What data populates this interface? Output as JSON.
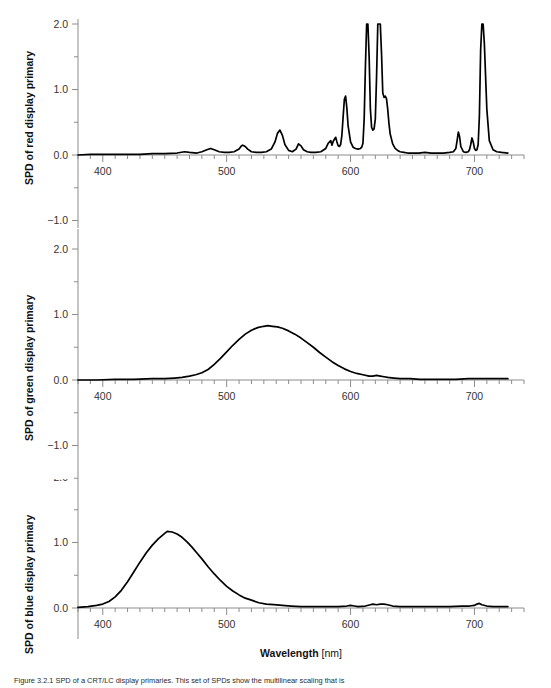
{
  "figure": {
    "xaxis_title_bold": "Wavelength",
    "xaxis_title_unit": "[nm]",
    "caption": "Figure 3.2.1 SPD of a CRT/LC display primaries. This set of SPDs show the multilinear scaling that is"
  },
  "chart_data": [
    {
      "type": "line",
      "id": "red",
      "title": "",
      "ylabel": "SPD of red display primary",
      "xlabel": "Wavelength [nm]",
      "xlim": [
        380,
        740
      ],
      "ylim": [
        -1.6,
        2.0
      ],
      "xticks_labeled": [
        400,
        500,
        600,
        700
      ],
      "xtick_minor_step": 10,
      "yticks_labeled": [
        2.0,
        1.0,
        0.0,
        -1.0
      ],
      "ytick_minor_step": 0.5,
      "grid": false,
      "legend": "none",
      "clipped_at": 2.0,
      "note": "Narrow-band phosphor emission spectrum; three peaks clipped at y=2.0",
      "x": [
        380,
        390,
        400,
        410,
        420,
        430,
        440,
        450,
        460,
        466,
        470,
        476,
        480,
        484,
        487,
        490,
        494,
        498,
        502,
        506,
        510,
        512,
        513,
        515,
        517,
        520,
        524,
        528,
        532,
        536,
        539,
        541,
        543,
        545,
        547,
        550,
        553,
        556,
        558,
        560,
        562,
        565,
        568,
        572,
        576,
        580,
        582,
        584,
        585,
        586,
        588,
        589,
        590,
        591,
        592,
        593,
        594,
        595,
        596,
        597,
        598,
        600,
        602,
        604,
        606,
        608,
        609,
        610,
        611,
        612,
        613,
        614,
        615,
        616,
        617,
        618,
        619,
        620,
        621,
        622,
        623,
        624,
        625,
        626,
        627,
        628,
        629,
        630,
        631,
        632,
        634,
        636,
        638,
        640,
        643,
        646,
        650,
        655,
        660,
        665,
        670,
        675,
        680,
        683,
        685,
        686,
        687,
        688,
        689,
        691,
        693,
        695,
        696,
        697,
        698,
        699,
        700,
        701,
        702,
        703,
        704,
        705,
        706,
        707,
        708,
        710,
        712,
        715,
        718,
        722,
        727
      ],
      "y": [
        0.0,
        0.01,
        0.01,
        0.01,
        0.01,
        0.01,
        0.02,
        0.02,
        0.03,
        0.05,
        0.04,
        0.03,
        0.05,
        0.08,
        0.1,
        0.08,
        0.05,
        0.04,
        0.04,
        0.05,
        0.09,
        0.14,
        0.15,
        0.13,
        0.09,
        0.05,
        0.04,
        0.04,
        0.05,
        0.09,
        0.2,
        0.33,
        0.38,
        0.3,
        0.16,
        0.07,
        0.05,
        0.09,
        0.17,
        0.14,
        0.08,
        0.05,
        0.04,
        0.04,
        0.05,
        0.1,
        0.18,
        0.22,
        0.15,
        0.21,
        0.27,
        0.2,
        0.14,
        0.13,
        0.16,
        0.3,
        0.58,
        0.85,
        0.9,
        0.72,
        0.45,
        0.2,
        0.12,
        0.1,
        0.09,
        0.1,
        0.12,
        0.18,
        0.55,
        1.35,
        2.0,
        2.0,
        1.5,
        0.7,
        0.42,
        0.38,
        0.4,
        0.55,
        1.2,
        2.0,
        2.0,
        2.0,
        1.55,
        0.95,
        0.88,
        0.9,
        0.86,
        0.7,
        0.48,
        0.32,
        0.17,
        0.1,
        0.07,
        0.05,
        0.04,
        0.03,
        0.03,
        0.03,
        0.04,
        0.03,
        0.03,
        0.03,
        0.04,
        0.05,
        0.1,
        0.22,
        0.35,
        0.28,
        0.13,
        0.05,
        0.04,
        0.05,
        0.08,
        0.16,
        0.26,
        0.2,
        0.1,
        0.07,
        0.08,
        0.16,
        0.6,
        1.6,
        2.0,
        2.0,
        1.7,
        0.7,
        0.22,
        0.08,
        0.05,
        0.04,
        0.03,
        0.03,
        0.02
      ]
    },
    {
      "type": "line",
      "id": "green",
      "title": "",
      "ylabel": "SPD of green display primary",
      "xlabel": "Wavelength [nm]",
      "xlim": [
        380,
        740
      ],
      "ylim": [
        -1.6,
        2.0
      ],
      "xticks_labeled": [
        400,
        500,
        600,
        700
      ],
      "xtick_minor_step": 10,
      "yticks_labeled": [
        2.0,
        1.0,
        0.0,
        -1.0
      ],
      "ytick_minor_step": 0.5,
      "grid": false,
      "legend": "none",
      "peak_wavelength": 533,
      "peak_value": 0.83,
      "note": "Broad single-lobe emission peaking near 533 nm at about 0.83",
      "x": [
        380,
        395,
        410,
        425,
        440,
        450,
        458,
        464,
        470,
        475,
        480,
        485,
        490,
        495,
        500,
        505,
        510,
        515,
        520,
        525,
        530,
        533,
        537,
        541,
        545,
        550,
        555,
        560,
        565,
        570,
        575,
        580,
        585,
        590,
        595,
        600,
        605,
        610,
        615,
        618,
        621,
        624,
        627,
        630,
        635,
        640,
        648,
        656,
        665,
        675,
        685,
        695,
        700,
        705,
        710,
        715,
        720,
        727
      ],
      "y": [
        0.0,
        0.0,
        0.01,
        0.01,
        0.02,
        0.02,
        0.03,
        0.04,
        0.06,
        0.08,
        0.11,
        0.16,
        0.24,
        0.33,
        0.43,
        0.53,
        0.62,
        0.7,
        0.76,
        0.8,
        0.82,
        0.83,
        0.82,
        0.81,
        0.79,
        0.75,
        0.7,
        0.64,
        0.57,
        0.5,
        0.42,
        0.35,
        0.28,
        0.22,
        0.17,
        0.13,
        0.1,
        0.08,
        0.06,
        0.06,
        0.07,
        0.06,
        0.05,
        0.04,
        0.03,
        0.02,
        0.02,
        0.01,
        0.01,
        0.01,
        0.01,
        0.02,
        0.02,
        0.02,
        0.02,
        0.02,
        0.02,
        0.02
      ]
    },
    {
      "type": "line",
      "id": "blue",
      "title": "",
      "ylabel": "SPD of blue display primary",
      "xlabel": "Wavelength [nm]",
      "xlim": [
        380,
        740
      ],
      "ylim": [
        -0.9,
        2.0
      ],
      "xticks_labeled": [
        400,
        500,
        600,
        700
      ],
      "xtick_minor_step": 10,
      "yticks_labeled": [
        2.0,
        1.0,
        0.0
      ],
      "ytick_minor_step": 0.5,
      "grid": false,
      "legend": "none",
      "peak_wavelength": 452,
      "peak_value": 1.17,
      "note": "Broad single-lobe emission peaking near 452 nm at about 1.17 with small red bumps",
      "x": [
        380,
        388,
        395,
        400,
        405,
        410,
        415,
        420,
        425,
        430,
        435,
        440,
        445,
        450,
        452,
        456,
        460,
        464,
        468,
        472,
        476,
        480,
        485,
        490,
        495,
        500,
        505,
        510,
        515,
        520,
        526,
        532,
        538,
        545,
        552,
        560,
        570,
        580,
        590,
        597,
        600,
        603,
        606,
        612,
        616,
        618,
        621,
        624,
        627,
        630,
        634,
        640,
        650,
        660,
        670,
        680,
        690,
        696,
        700,
        702,
        704,
        706,
        710,
        715,
        720,
        727
      ],
      "y": [
        0.01,
        0.02,
        0.04,
        0.06,
        0.1,
        0.17,
        0.27,
        0.4,
        0.55,
        0.7,
        0.84,
        0.96,
        1.06,
        1.14,
        1.17,
        1.16,
        1.13,
        1.08,
        1.01,
        0.93,
        0.84,
        0.75,
        0.63,
        0.52,
        0.42,
        0.33,
        0.26,
        0.2,
        0.15,
        0.12,
        0.08,
        0.06,
        0.05,
        0.04,
        0.03,
        0.02,
        0.02,
        0.02,
        0.02,
        0.03,
        0.04,
        0.03,
        0.02,
        0.03,
        0.05,
        0.06,
        0.05,
        0.06,
        0.06,
        0.05,
        0.03,
        0.02,
        0.02,
        0.02,
        0.02,
        0.02,
        0.03,
        0.03,
        0.04,
        0.06,
        0.07,
        0.05,
        0.03,
        0.02,
        0.02,
        0.02
      ]
    }
  ]
}
